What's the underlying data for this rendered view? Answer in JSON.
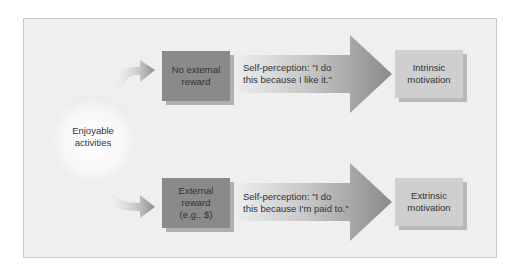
{
  "diagram": {
    "source_node": {
      "label_line1": "Enjoyable",
      "label_line2": "activities"
    },
    "top_branch": {
      "condition": {
        "line1": "No external",
        "line2": "reward"
      },
      "arrow_text": {
        "line1": "Self-perception: \"I do",
        "line2": "this because I like it.\""
      },
      "outcome": {
        "line1": "Intrinsic",
        "line2": "motivation"
      }
    },
    "bottom_branch": {
      "condition": {
        "line1": "External",
        "line2": "reward",
        "line3": "(e.g., $)"
      },
      "arrow_text": {
        "line1": "Self-perception: \"I do",
        "line2": "this because I'm paid to.\""
      },
      "outcome": {
        "line1": "Extrinsic",
        "line2": "motivation"
      }
    },
    "colors": {
      "background": "#efefef",
      "dark_box": "#8a8a8a",
      "light_box": "#cfcfcf",
      "arrow": "#8d8d8d"
    }
  }
}
